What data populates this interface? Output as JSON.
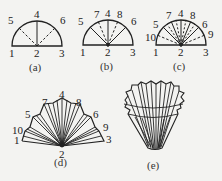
{
  "figures": [
    {
      "id": "a",
      "caption": "(a)",
      "points": {
        "p1": "1",
        "p2": "2",
        "p3": "3",
        "p4": "4",
        "p5": "5",
        "p6": "6"
      }
    },
    {
      "id": "b",
      "caption": "(b)",
      "points": {
        "p1": "1",
        "p2": "2",
        "p3": "3",
        "p4": "4",
        "p5": "5",
        "p6": "6",
        "p7": "7",
        "p8": "8"
      }
    },
    {
      "id": "c",
      "caption": "(c)",
      "points": {
        "p1": "1",
        "p2": "2",
        "p3": "3",
        "p4": "4",
        "p5": "5",
        "p6": "6",
        "p7": "7",
        "p8": "8",
        "p9": "9",
        "p10": "10"
      }
    },
    {
      "id": "d",
      "caption": "(d)",
      "points": {
        "p1": "1",
        "p2": "2",
        "p3": "3",
        "p4": "4",
        "p5": "5",
        "p6": "6",
        "p7": "7",
        "p8": "8",
        "p9": "9",
        "p10": "10"
      }
    },
    {
      "id": "e",
      "caption": "(e)"
    }
  ],
  "colors": {
    "line": "#222222",
    "background": "#f3f3f1"
  }
}
